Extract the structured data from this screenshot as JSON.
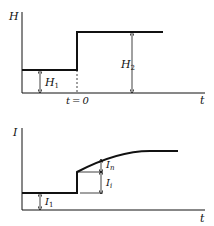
{
  "top_plot": {
    "y_label": "H",
    "x_label": "t",
    "event_label": "t = 0",
    "low_level_label": "H",
    "low_level_sub": "1",
    "high_level_label": "H",
    "high_level_sub": "2"
  },
  "bottom_plot": {
    "y_label": "I",
    "x_label": "t",
    "initial_label": "I",
    "initial_sub": "1",
    "instant_label": "I",
    "instant_sub": "i",
    "gradual_label": "I",
    "gradual_sub": "n"
  },
  "colors": {
    "line": "#111111",
    "background": "#ffffff"
  }
}
